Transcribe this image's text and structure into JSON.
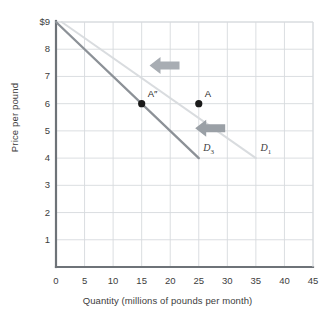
{
  "chart_data": {
    "type": "line",
    "title": "",
    "xlabel": "Quantity (millions of pounds per month)",
    "ylabel": "Price per pound",
    "xlim": [
      0,
      45
    ],
    "ylim": [
      0,
      9
    ],
    "grid": true,
    "legend_position": "inline-curve-labels",
    "xticks": [
      "0",
      "5",
      "10",
      "15",
      "20",
      "25",
      "30",
      "35",
      "40",
      "45"
    ],
    "yticks": [
      "1",
      "2",
      "3",
      "4",
      "5",
      "6",
      "7",
      "8",
      "$9"
    ],
    "series": [
      {
        "name": "D1",
        "label": "D",
        "subscript": "1",
        "color": "#d9dcdf",
        "x": [
          1,
          35
        ],
        "y": [
          9,
          4
        ]
      },
      {
        "name": "D3",
        "label": "D",
        "subscript": "3",
        "color": "#8c9197",
        "x": [
          0,
          25
        ],
        "y": [
          9,
          4
        ]
      }
    ],
    "points": [
      {
        "label": "A″",
        "x": 15,
        "y": 6,
        "color": "#1a1a1a"
      },
      {
        "label": "A",
        "x": 25,
        "y": 6,
        "color": "#1a1a1a"
      }
    ],
    "annotations": [
      {
        "name": "shift-arrow-upper",
        "direction": "left",
        "x": 19,
        "y": 7.4,
        "color": "#a8adb3"
      },
      {
        "name": "shift-arrow-lower",
        "direction": "left",
        "x": 27,
        "y": 5.1,
        "color": "#9aa0a6"
      }
    ],
    "colors": {
      "grid": "#d7dade",
      "axis": "#6e7378",
      "text": "#3d3d3d",
      "background": "#ffffff"
    }
  }
}
